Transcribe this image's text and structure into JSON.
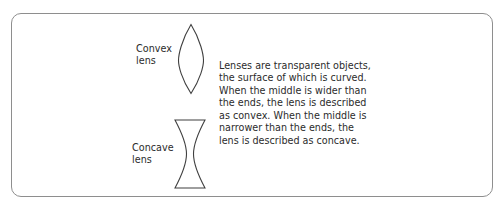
{
  "figure": {
    "background_color": "#ffffff",
    "frame": {
      "name": "rounded-rectangle-border",
      "stroke_color": "#8e8e8e",
      "corner_radius_px": 10
    },
    "diagrams": [
      {
        "id": "convex",
        "shape_name": "convex-lens",
        "label": "Convex\nlens",
        "stroke_color": "#3f3f3f"
      },
      {
        "id": "concave",
        "shape_name": "concave-lens",
        "label": "Concave\nlens",
        "stroke_color": "#3f3f3f"
      }
    ],
    "description": "Lenses are transparent objects,\nthe surface of which is curved.\nWhen the middle is wider than\nthe ends, the lens is described\nas convex. When the middle is\nnarrower than the ends, the\nlens is described as concave.",
    "text_color": "#2b2b2b"
  }
}
